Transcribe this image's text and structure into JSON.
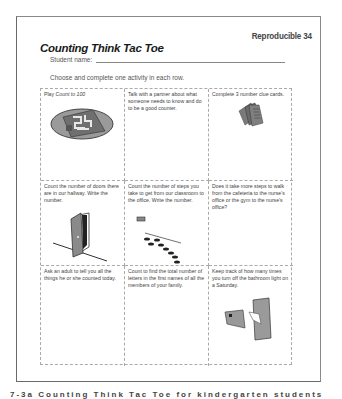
{
  "header": {
    "reproducible_label": "Reproducible 34",
    "title": "Counting Think Tac Toe",
    "student_name_label": "Student name:",
    "student_name_value": "",
    "instructions": "Choose and complete one activity in each row."
  },
  "grid": {
    "cells": [
      {
        "text_prefix": "Play ",
        "text_italic": "Count to 100",
        "text": "",
        "illustration": "board-game-icon"
      },
      {
        "text": "Talk with a partner about what someone needs to know and do to be a good counter.",
        "illustration": ""
      },
      {
        "text": "Complete 3 number clue cards.",
        "illustration": "cards-icon"
      },
      {
        "text": "Count the number of doors there are in our hallway. Write the number.",
        "illustration": "door-icon"
      },
      {
        "text": "Count the number of steps you take to get from our classroom to the office. Write the number.",
        "illustration": "footsteps-icon"
      },
      {
        "text": "Does it take more steps to walk from the cafeteria to the nurse's office or the gym to the nurse's office?",
        "illustration": ""
      },
      {
        "text": "Ask an adult to tell you all the things he or she counted today.",
        "illustration": ""
      },
      {
        "text": "Count to find the total number of letters in the first names of all the members of your family.",
        "illustration": ""
      },
      {
        "text": "Keep track of how many times you turn off the bathroom light on a Saturday.",
        "illustration": "light-switch-icon"
      }
    ]
  },
  "caption": {
    "text": "7-3a Counting Think Tac Toe for kindergarten students"
  },
  "colors": {
    "frame": "#7a7a7a",
    "illustration_gray": "#8c8c8c",
    "dark_gray": "#3a3a3a"
  }
}
